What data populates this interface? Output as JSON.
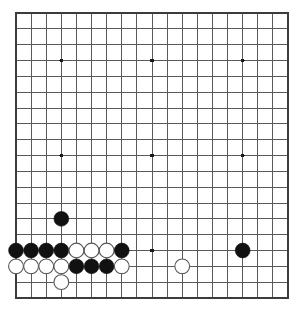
{
  "board": {
    "game": "Go",
    "size": 19,
    "label": "go-board-19x19",
    "background_color": "#ffffff",
    "line_color": "#5a5a5a",
    "border_color": "#3c3c3c",
    "star_point_color": "#1a1a1a",
    "black_stone_color": "#111111",
    "white_stone_color": "#ffffff",
    "white_stone_border_color": "#555555",
    "geometry": {
      "left": 16,
      "top": 13,
      "right": 288,
      "bottom": 298,
      "col_step": 15.111,
      "row_step": 15.833,
      "stone_radius": 7.4,
      "star_radius": 1.9,
      "border_width": 2.0,
      "line_width": 1.0
    },
    "star_points": [
      {
        "col": 4,
        "row": 4
      },
      {
        "col": 10,
        "row": 4
      },
      {
        "col": 16,
        "row": 4
      },
      {
        "col": 4,
        "row": 10
      },
      {
        "col": 10,
        "row": 10
      },
      {
        "col": 16,
        "row": 10
      },
      {
        "col": 4,
        "row": 16
      },
      {
        "col": 10,
        "row": 16
      },
      {
        "col": 16,
        "row": 16
      }
    ],
    "stones": [
      {
        "color": "black",
        "col": 4,
        "row": 14
      },
      {
        "color": "black",
        "col": 1,
        "row": 16
      },
      {
        "color": "black",
        "col": 2,
        "row": 16
      },
      {
        "color": "black",
        "col": 3,
        "row": 16
      },
      {
        "color": "black",
        "col": 4,
        "row": 16
      },
      {
        "color": "white",
        "col": 5,
        "row": 16
      },
      {
        "color": "white",
        "col": 6,
        "row": 16
      },
      {
        "color": "white",
        "col": 7,
        "row": 16
      },
      {
        "color": "black",
        "col": 8,
        "row": 16
      },
      {
        "color": "black",
        "col": 16,
        "row": 16
      },
      {
        "color": "white",
        "col": 1,
        "row": 17
      },
      {
        "color": "white",
        "col": 2,
        "row": 17
      },
      {
        "color": "white",
        "col": 3,
        "row": 17
      },
      {
        "color": "white",
        "col": 4,
        "row": 17
      },
      {
        "color": "black",
        "col": 5,
        "row": 17
      },
      {
        "color": "black",
        "col": 6,
        "row": 17
      },
      {
        "color": "black",
        "col": 7,
        "row": 17
      },
      {
        "color": "white",
        "col": 8,
        "row": 17
      },
      {
        "color": "white",
        "col": 12,
        "row": 17
      },
      {
        "color": "white",
        "col": 4,
        "row": 18
      }
    ],
    "counts": {
      "black_stones": 12,
      "white_stones": 10,
      "total_stones": 22
    }
  }
}
